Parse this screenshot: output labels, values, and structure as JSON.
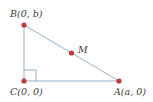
{
  "diagram": {
    "type": "right-triangle-coordinate",
    "colors": {
      "line": "#8fb3cf",
      "point": "#c23a3a",
      "label": "#3a3a3a",
      "right_angle_marker": "#8fb3cf"
    },
    "points": [
      {
        "id": "B",
        "label": "B(0, b)",
        "x": 24,
        "y": 25
      },
      {
        "id": "C",
        "label": "C(0, 0)",
        "x": 24,
        "y": 81
      },
      {
        "id": "A",
        "label": "A(a, 0)",
        "x": 119,
        "y": 81
      },
      {
        "id": "M",
        "label": "M",
        "x": 71.5,
        "y": 53
      }
    ],
    "segments": [
      {
        "from": "B",
        "to": "C"
      },
      {
        "from": "C",
        "to": "A"
      },
      {
        "from": "B",
        "to": "A"
      }
    ],
    "right_angle_at": "C"
  },
  "labels": {
    "B": "B(0, b)",
    "C": "C(0, 0)",
    "A": "A(a, 0)",
    "M": "M"
  }
}
